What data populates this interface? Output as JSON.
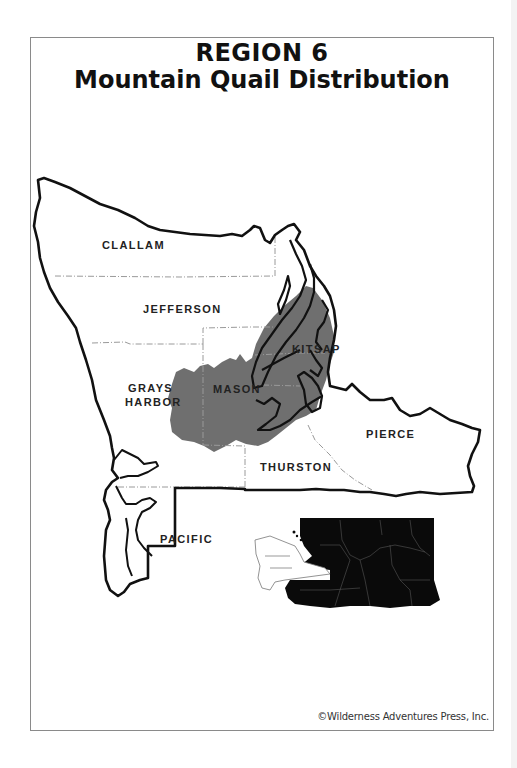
{
  "title": {
    "line1": "REGION 6",
    "line2": "Mountain Quail Distribution"
  },
  "map": {
    "legend_meaning": "shaded area = mountain quail distribution",
    "colors": {
      "outline": "#111111",
      "distribution_fill": "#6f6f6f",
      "county_border": "#9a9a9a",
      "inset_state_fill": "#0a0a0a"
    },
    "counties": [
      {
        "name": "CLALLAM"
      },
      {
        "name": "JEFFERSON"
      },
      {
        "name": "KITSAP",
        "label": "KITSAP"
      },
      {
        "name": "GRAYS HARBOR",
        "label_line1": "GRAYS",
        "label_line2": "HARBOR"
      },
      {
        "name": "MASON"
      },
      {
        "name": "PIERCE"
      },
      {
        "name": "THURSTON"
      },
      {
        "name": "PACIFIC"
      }
    ],
    "inset": {
      "description": "Washington State locator map; Region 6 shown in white, rest of state black"
    }
  },
  "credit": "©Wilderness Adventures Press, Inc."
}
